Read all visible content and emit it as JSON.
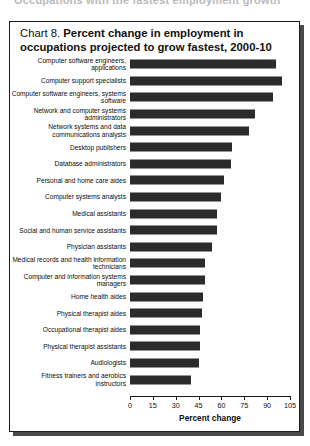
{
  "page": {
    "top_cutoff_text": "Occupations with the fastest employment growth"
  },
  "chart": {
    "label": "Chart 8.",
    "title": "Percent change in employment in occupations projected to grow fastest, 2000-10"
  },
  "chart_data": {
    "type": "bar",
    "orientation": "horizontal",
    "title": "Chart 8. Percent change in employment in occupations projected to grow fastest, 2000-10",
    "xlabel": "Percent change",
    "ylabel": "",
    "xlim": [
      0,
      105
    ],
    "xticks": [
      0,
      15,
      30,
      45,
      60,
      75,
      90,
      105
    ],
    "grid": false,
    "legend": false,
    "bar_color": "#2b2b2b",
    "categories": [
      "Computer software engineers, applications",
      "Computer support specialists",
      "Computer software engineers, systems software",
      "Network and computer systems administrators",
      "Network systems and data communications analysts",
      "Desktop publishers",
      "Database administrators",
      "Personal and home care aides",
      "Computer systems analysts",
      "Medical assistants",
      "Social and human service assistants",
      "Physician assistants",
      "Medical records and health information technicians",
      "Computer and information systems managers",
      "Home health aides",
      "Physical therapist aides",
      "Occupational therapist aides",
      "Physical therapist assistants",
      "Audiologists",
      "Fitness trainers and aerobics instructors"
    ],
    "values": [
      96,
      100,
      94,
      82,
      78,
      67,
      66,
      62,
      60,
      57,
      57,
      54,
      49,
      49,
      48,
      47,
      46,
      46,
      45,
      40
    ]
  }
}
